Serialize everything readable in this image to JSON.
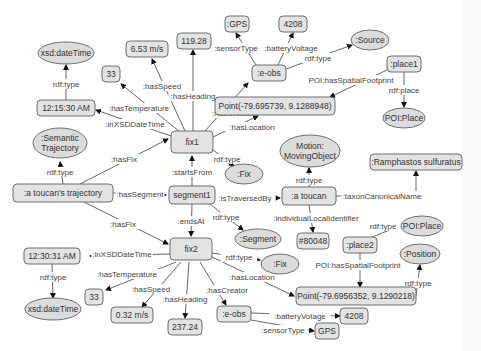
{
  "diagram": {
    "colors": {
      "node_fill": "#e3e3e3",
      "class_fill": "#dcdcdc",
      "stroke": "#6f6f6f",
      "text": "#333333",
      "edge": "#555555",
      "background": "#ffffff"
    },
    "nodes": [
      {
        "id": "traj",
        "label": ":a toucan's trajectory",
        "shape": "rect",
        "x": 63,
        "y": 193,
        "w": 100,
        "h": 18
      },
      {
        "id": "semtraj",
        "label": ":Semantic\nTrajectory",
        "shape": "ellipse",
        "x": 60,
        "y": 143,
        "w": 54,
        "h": 30
      },
      {
        "id": "fix1",
        "label": "fix1",
        "shape": "rect",
        "x": 192,
        "y": 142,
        "w": 42,
        "h": 22
      },
      {
        "id": "seg1",
        "label": "segment1",
        "shape": "rect",
        "x": 192,
        "y": 195,
        "w": 46,
        "h": 18
      },
      {
        "id": "fix2",
        "label": "fix2",
        "shape": "rect",
        "x": 191,
        "y": 249,
        "w": 42,
        "h": 22
      },
      {
        "id": "time1",
        "label": "12:15:30 AM",
        "shape": "rect",
        "x": 66,
        "y": 108,
        "w": 58,
        "h": 16
      },
      {
        "id": "xsd1",
        "label": "xsd:dateTime",
        "shape": "ellipse",
        "x": 66,
        "y": 53,
        "w": 56,
        "h": 22
      },
      {
        "id": "temp1",
        "label": "33",
        "shape": "rect",
        "x": 111,
        "y": 74,
        "w": 18,
        "h": 16
      },
      {
        "id": "speed1",
        "label": "6.53 m/s",
        "shape": "rect",
        "x": 147,
        "y": 49,
        "w": 42,
        "h": 16
      },
      {
        "id": "head1",
        "label": "119.28",
        "shape": "rect",
        "x": 194,
        "y": 41,
        "w": 34,
        "h": 16
      },
      {
        "id": "eobs1",
        "label": ":e-obs",
        "shape": "rect",
        "x": 269,
        "y": 73,
        "w": 34,
        "h": 16
      },
      {
        "id": "gps1",
        "label": ":GPS",
        "shape": "rect",
        "x": 237,
        "y": 24,
        "w": 24,
        "h": 16
      },
      {
        "id": "batt1",
        "label": "4208",
        "shape": "rect",
        "x": 293,
        "y": 24,
        "w": 28,
        "h": 16
      },
      {
        "id": "source",
        "label": ":Source",
        "shape": "ellipse",
        "x": 370,
        "y": 40,
        "w": 38,
        "h": 20
      },
      {
        "id": "point1",
        "label": "Point(-79.695739, 9.1288948)",
        "shape": "rect",
        "x": 275,
        "y": 106,
        "w": 120,
        "h": 18
      },
      {
        "id": "place1",
        "label": ":place1",
        "shape": "rect",
        "x": 404,
        "y": 64,
        "w": 34,
        "h": 16
      },
      {
        "id": "poiplace1",
        "label": "POI:Place",
        "shape": "ellipse",
        "x": 404,
        "y": 118,
        "w": 42,
        "h": 20
      },
      {
        "id": "fixclass1",
        "label": ":Fix",
        "shape": "ellipse",
        "x": 244,
        "y": 174,
        "w": 38,
        "h": 20
      },
      {
        "id": "motion",
        "label": "Motion:\nMovingObject",
        "shape": "ellipse",
        "x": 310,
        "y": 151,
        "w": 60,
        "h": 32
      },
      {
        "id": "toucan",
        "label": ":a toucan",
        "shape": "rect",
        "x": 309,
        "y": 196,
        "w": 54,
        "h": 18
      },
      {
        "id": "species",
        "label": ":Ramphastos sulfuratus",
        "shape": "rect",
        "x": 416,
        "y": 162,
        "w": 92,
        "h": 16
      },
      {
        "id": "segclass",
        "label": ":Segment",
        "shape": "ellipse",
        "x": 258,
        "y": 239,
        "w": 46,
        "h": 20
      },
      {
        "id": "localid",
        "label": "#80048",
        "shape": "rect",
        "x": 313,
        "y": 241,
        "w": 32,
        "h": 16
      },
      {
        "id": "place2",
        "label": ":place2",
        "shape": "rect",
        "x": 360,
        "y": 245,
        "w": 34,
        "h": 16
      },
      {
        "id": "poiplace2",
        "label": "POI:Place",
        "shape": "ellipse",
        "x": 422,
        "y": 226,
        "w": 42,
        "h": 20
      },
      {
        "id": "position",
        "label": ":Position",
        "shape": "ellipse",
        "x": 420,
        "y": 254,
        "w": 40,
        "h": 20
      },
      {
        "id": "fixclass2",
        "label": ":Fix",
        "shape": "ellipse",
        "x": 280,
        "y": 264,
        "w": 38,
        "h": 20
      },
      {
        "id": "point2",
        "label": "Point(-79.6956352, 9.1290218)",
        "shape": "rect",
        "x": 356,
        "y": 296,
        "w": 120,
        "h": 18
      },
      {
        "id": "time2",
        "label": "12:30:31 AM",
        "shape": "rect",
        "x": 52,
        "y": 256,
        "w": 56,
        "h": 16
      },
      {
        "id": "xsd2",
        "label": "xsd:dateTime",
        "shape": "ellipse",
        "x": 53,
        "y": 309,
        "w": 56,
        "h": 22
      },
      {
        "id": "temp2",
        "label": "33",
        "shape": "rect",
        "x": 94,
        "y": 297,
        "w": 18,
        "h": 16
      },
      {
        "id": "speed2",
        "label": "0.32 m/s",
        "shape": "rect",
        "x": 132,
        "y": 315,
        "w": 42,
        "h": 16
      },
      {
        "id": "head2",
        "label": "237.24",
        "shape": "rect",
        "x": 185,
        "y": 327,
        "w": 34,
        "h": 16
      },
      {
        "id": "eobs2",
        "label": ":e-obs",
        "shape": "rect",
        "x": 234,
        "y": 314,
        "w": 34,
        "h": 16
      },
      {
        "id": "batt2",
        "label": "4208",
        "shape": "rect",
        "x": 354,
        "y": 316,
        "w": 28,
        "h": 16
      },
      {
        "id": "gps2",
        "label": "GPS",
        "shape": "rect",
        "x": 327,
        "y": 331,
        "w": 24,
        "h": 16
      }
    ],
    "edges": [
      {
        "path": "M63,184 L60,162",
        "label": "rdf:type",
        "lx": 60,
        "ly": 172,
        "arrow": [
          60,
          160
        ]
      },
      {
        "path": "M80,184 L168,139",
        "label": ":hasFix",
        "lx": 124,
        "ly": 159,
        "arrow": [
          168,
          138
        ]
      },
      {
        "path": "M113,193 L166,195",
        "label": ":hasSegment",
        "lx": 140,
        "ly": 194,
        "arrow": [
          168,
          195
        ]
      },
      {
        "path": "M84,202 L168,244",
        "label": ":hasFix",
        "lx": 123,
        "ly": 224,
        "arrow": [
          169,
          244
        ]
      },
      {
        "path": "M192,186 L192,156",
        "label": ":startsFrom",
        "lx": 192,
        "ly": 172,
        "arrow": [
          192,
          154
        ]
      },
      {
        "path": "M192,204 L191,236",
        "label": ":endsAt",
        "lx": 191,
        "ly": 221,
        "arrow": [
          191,
          238
        ]
      },
      {
        "path": "M215,198 L280,198",
        "label": ":isTraversedBy",
        "lx": 245,
        "ly": 198,
        "arrow": [
          281,
          198
        ]
      },
      {
        "path": "M210,204 L243,230",
        "label": "rdf:type",
        "lx": 226,
        "ly": 217,
        "arrow": [
          244,
          231
        ]
      },
      {
        "path": "M171,136 L96,110",
        "label": ":inXSDDateTime",
        "lx": 135,
        "ly": 124,
        "arrow": [
          96,
          110
        ]
      },
      {
        "path": "M66,100 L66,65",
        "label": "rdf:type",
        "lx": 66,
        "ly": 84,
        "arrow": [
          66,
          63
        ]
      },
      {
        "path": "M180,132 L121,84",
        "label": ":hasTemperature",
        "lx": 139,
        "ly": 108,
        "arrow": [
          121,
          84
        ]
      },
      {
        "path": "M185,131 L152,59",
        "label": ":hasSpeed",
        "lx": 162,
        "ly": 86,
        "arrow": [
          152,
          58
        ]
      },
      {
        "path": "M193,131 L193,50",
        "label": ":hasHeading",
        "lx": 193,
        "ly": 96,
        "arrow": [
          193,
          50
        ]
      },
      {
        "path": "M205,131 L248,83",
        "label": ":hasCreator",
        "lx": 233,
        "ly": 113,
        "arrow": [
          248,
          82
        ]
      },
      {
        "path": "M213,137 L258,116",
        "label": ":hasLocation",
        "lx": 252,
        "ly": 127,
        "arrow": [
          259,
          116
        ]
      },
      {
        "path": "M213,150 L234,166",
        "label": "rdf:type",
        "lx": 227,
        "ly": 159,
        "arrow": [
          235,
          166
        ]
      },
      {
        "path": "M256,65 L236,33",
        "label": ":sensorType",
        "lx": 236,
        "ly": 48,
        "arrow": [
          236,
          34
        ]
      },
      {
        "path": "M278,65 L293,33",
        "label": ":batteryVoltage",
        "lx": 291,
        "ly": 48,
        "arrow": [
          293,
          34
        ]
      },
      {
        "path": "M286,69 L352,45",
        "label": "rdf:type",
        "lx": 318,
        "ly": 58,
        "arrow": [
          352,
          45
        ]
      },
      {
        "path": "M387,70 L330,97",
        "label": "POI:hasSpatialFootprint",
        "lx": 351,
        "ly": 80,
        "arrow": [
          330,
          97
        ]
      },
      {
        "path": "M404,72 L404,107",
        "label": "rdf:place",
        "lx": 404,
        "ly": 90,
        "arrow": [
          404,
          108
        ]
      },
      {
        "path": "M309,187 L309,168",
        "label": "rdf:type",
        "lx": 309,
        "ly": 180,
        "arrow": [
          309,
          167
        ]
      },
      {
        "path": "M336,196 L416,196 L416,171",
        "label": ":taxonCanonicalName",
        "lx": 382,
        "ly": 196,
        "arrow": [
          416,
          170
        ]
      },
      {
        "path": "M309,205 L313,232",
        "label": ":individualLocalIdentifier",
        "lx": 316,
        "ly": 218,
        "arrow": [
          313,
          233
        ]
      },
      {
        "path": "M372,237 L400,226",
        "label": "rdf:type",
        "lx": 383,
        "ly": 226,
        "arrow": [
          400,
          226
        ]
      },
      {
        "path": "M360,253 L360,287",
        "label": "POI:hasSpatialFootprint",
        "lx": 358,
        "ly": 265,
        "arrow": [
          360,
          288
        ]
      },
      {
        "path": "M416,296 L420,265",
        "label": "rdf:type",
        "lx": 418,
        "ly": 283,
        "arrow": [
          420,
          264
        ]
      },
      {
        "path": "M170,254 L90,256",
        "label": ":inXSDDateTime",
        "lx": 122,
        "ly": 254,
        "arrow": [
          90,
          256
        ]
      },
      {
        "path": "M52,264 L53,298",
        "label": "rdf:type",
        "lx": 53,
        "ly": 277,
        "arrow": [
          53,
          298
        ]
      },
      {
        "path": "M176,262 L106,290",
        "label": ":hasTemperature",
        "lx": 127,
        "ly": 274,
        "arrow": [
          106,
          290
        ]
      },
      {
        "path": "M181,262 L142,307",
        "label": ":hasSpeed",
        "lx": 151,
        "ly": 289,
        "arrow": [
          142,
          306
        ]
      },
      {
        "path": "M189,262 L185,318",
        "label": ":hasHeading",
        "lx": 185,
        "ly": 299,
        "arrow": [
          185,
          319
        ]
      },
      {
        "path": "M200,262 L226,305",
        "label": ":hasCreator",
        "lx": 227,
        "ly": 290,
        "arrow": [
          226,
          306
        ]
      },
      {
        "path": "M212,257 L294,296",
        "label": ":hasLocation",
        "lx": 252,
        "ly": 277,
        "arrow": [
          295,
          296
        ]
      },
      {
        "path": "M212,253 L260,260",
        "label": "rdf:type",
        "lx": 239,
        "ly": 257,
        "arrow": [
          261,
          260
        ]
      },
      {
        "path": "M251,313 L340,316",
        "label": ":batteryVotage",
        "lx": 300,
        "ly": 316,
        "arrow": [
          340,
          316
        ]
      },
      {
        "path": "M251,320 L314,331",
        "label": ":sensorType",
        "lx": 283,
        "ly": 330,
        "arrow": [
          315,
          331
        ]
      }
    ]
  }
}
